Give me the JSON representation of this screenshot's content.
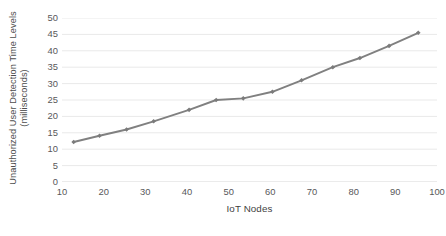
{
  "chart_data": {
    "type": "line",
    "title": "",
    "subtitle": "",
    "xlabel": "IoT Nodes",
    "ylabel": "Unauthorized User Detection Time Levels (milliseconds)",
    "ylabel_line1": "Unauthorized User Detection Time Levels",
    "ylabel_line2": "(milliseconds)",
    "xlim": [
      10,
      100
    ],
    "ylim": [
      0,
      50
    ],
    "xticks": [
      10,
      20,
      30,
      40,
      50,
      60,
      70,
      80,
      90,
      100
    ],
    "yticks": [
      0,
      5,
      10,
      15,
      20,
      25,
      30,
      35,
      40,
      45,
      50
    ],
    "xtick_labels": [
      "10",
      "20",
      "30",
      "40",
      "50",
      "60",
      "70",
      "80",
      "90",
      "100"
    ],
    "ytick_labels": [
      "50",
      "45",
      "40",
      "35",
      "30",
      "25",
      "20",
      "15",
      "10",
      "5",
      "0"
    ],
    "grid": "horizontal",
    "legend": "none",
    "series": [
      {
        "name": "Unauthorized user detection time",
        "color": "#808080",
        "marker": "diamond",
        "x": [
          12.8,
          19.0,
          25.5,
          32.0,
          40.5,
          47.0,
          53.5,
          60.5,
          67.5,
          75.0,
          81.5,
          88.5,
          95.5
        ],
        "y": [
          12.2,
          14.1,
          16.0,
          18.5,
          22.0,
          25.0,
          25.5,
          27.5,
          31.0,
          35.0,
          37.8,
          41.5,
          45.5
        ]
      }
    ]
  },
  "style": {
    "line_color": "#808080",
    "marker_color": "#7b7b7b",
    "grid_color": "#e9e9e9",
    "axis_color": "#d6d6d6",
    "text_color": "#58585a",
    "background": "#ffffff"
  }
}
